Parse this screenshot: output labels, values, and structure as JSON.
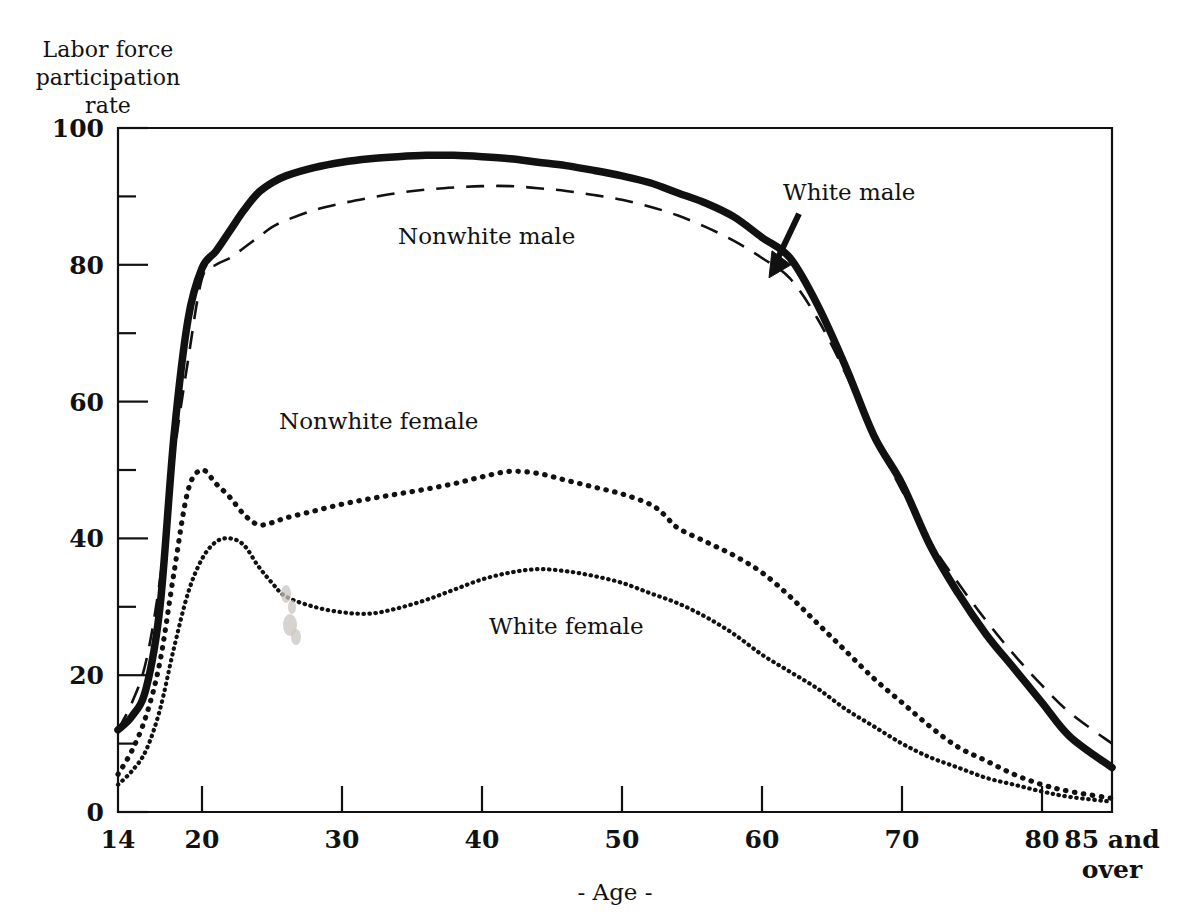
{
  "figure": {
    "y_axis_caption": "Labor force\nparticipation\nrate",
    "x_axis_caption": "- Age -"
  },
  "chart_data": {
    "type": "line",
    "title": "",
    "subtitle": "",
    "xlabel": "- Age -",
    "ylabel": "Labor force participation rate",
    "xlim": [
      14,
      85
    ],
    "ylim": [
      0,
      100
    ],
    "grid": false,
    "legend_position": "inline-annotations",
    "x_ticks": [
      {
        "value": 14,
        "label": "14"
      },
      {
        "value": 20,
        "label": "20"
      },
      {
        "value": 30,
        "label": "30"
      },
      {
        "value": 40,
        "label": "40"
      },
      {
        "value": 50,
        "label": "50"
      },
      {
        "value": 60,
        "label": "60"
      },
      {
        "value": 70,
        "label": "70"
      },
      {
        "value": 80,
        "label": "80"
      },
      {
        "value": 85,
        "label": "85 and\nover"
      }
    ],
    "y_ticks_major": [
      {
        "value": 0,
        "label": "0"
      },
      {
        "value": 20,
        "label": "20"
      },
      {
        "value": 40,
        "label": "40"
      },
      {
        "value": 60,
        "label": "60"
      },
      {
        "value": 80,
        "label": "80"
      },
      {
        "value": 100,
        "label": "100"
      }
    ],
    "y_ticks_minor": [
      10,
      30,
      50,
      70,
      90
    ],
    "annotations": [
      {
        "text": "White male",
        "x": 61.5,
        "y": 89.5,
        "has_arrow": true
      },
      {
        "text": "Nonwhite male",
        "x": 34.0,
        "y": 83.0,
        "has_arrow": false
      },
      {
        "text": "Nonwhite female",
        "x": 25.5,
        "y": 56.0,
        "has_arrow": false
      },
      {
        "text": "White female",
        "x": 40.5,
        "y": 26.0,
        "has_arrow": false
      }
    ],
    "series": [
      {
        "name": "White male",
        "style": "solid-thick",
        "x": [
          14,
          15,
          16,
          17,
          18,
          19,
          20,
          21,
          22,
          23,
          24,
          25,
          26,
          28,
          30,
          32,
          34,
          36,
          38,
          40,
          42,
          44,
          46,
          48,
          50,
          52,
          54,
          56,
          58,
          60,
          62,
          64,
          66,
          68,
          70,
          72,
          74,
          76,
          78,
          80,
          82,
          85
        ],
        "values": [
          12,
          14,
          18,
          30,
          55,
          72,
          79.5,
          82,
          85,
          88,
          90.5,
          92,
          93,
          94.2,
          95,
          95.5,
          95.8,
          96,
          96,
          95.8,
          95.5,
          95,
          94.5,
          93.8,
          93,
          92,
          90.5,
          89,
          87,
          84,
          81,
          74,
          65,
          55,
          48,
          39,
          32,
          26,
          21,
          16,
          11,
          6.5
        ]
      },
      {
        "name": "Nonwhite male",
        "style": "dashed",
        "x": [
          14,
          15,
          16,
          17,
          18,
          19,
          20,
          21,
          22,
          23,
          24,
          25,
          26,
          28,
          30,
          32,
          34,
          36,
          38,
          40,
          42,
          44,
          46,
          48,
          50,
          52,
          54,
          56,
          58,
          60,
          62,
          64,
          66,
          68,
          70,
          72,
          74,
          76,
          78,
          80,
          82,
          85
        ],
        "values": [
          12,
          16,
          22,
          34,
          52,
          66,
          78,
          80,
          81,
          82.5,
          84,
          85.5,
          86.5,
          88,
          89,
          89.8,
          90.5,
          91,
          91.3,
          91.5,
          91.5,
          91.2,
          90.8,
          90.2,
          89.5,
          88.5,
          87.2,
          85.5,
          83.5,
          81,
          78,
          72,
          64,
          55,
          47,
          39.5,
          33.5,
          28,
          23,
          18.5,
          14.5,
          10
        ]
      },
      {
        "name": "Nonwhite female",
        "style": "dotted-heavy",
        "x": [
          14,
          15,
          16,
          17,
          18,
          19,
          20,
          21,
          22,
          23,
          24,
          25,
          26,
          28,
          30,
          32,
          34,
          36,
          38,
          40,
          42,
          44,
          46,
          48,
          50,
          52,
          53,
          54,
          56,
          58,
          60,
          62,
          64,
          66,
          68,
          70,
          72,
          74,
          76,
          78,
          80,
          82,
          85
        ],
        "values": [
          5.5,
          9,
          14,
          22,
          35,
          47,
          50,
          48,
          46,
          43.5,
          42,
          42.3,
          43,
          44,
          45,
          45.8,
          46.5,
          47.2,
          48,
          49,
          49.8,
          49.5,
          48.5,
          47.5,
          46.5,
          45,
          43.5,
          41.5,
          39.5,
          37.5,
          35,
          31.5,
          27.5,
          23.5,
          19.5,
          16,
          12.5,
          9.5,
          7.5,
          5.5,
          4,
          3,
          2
        ]
      },
      {
        "name": "White female",
        "style": "dotted-fine",
        "x": [
          14,
          15,
          16,
          17,
          18,
          19,
          20,
          21,
          22,
          23,
          24,
          25,
          26,
          28,
          30,
          32,
          34,
          36,
          38,
          40,
          42,
          44,
          46,
          48,
          50,
          52,
          54,
          56,
          58,
          60,
          62,
          64,
          66,
          68,
          70,
          72,
          74,
          76,
          78,
          80,
          82,
          85
        ],
        "values": [
          4,
          6,
          9,
          15,
          24,
          32,
          37,
          39.5,
          40,
          39,
          36,
          33.5,
          31.5,
          30,
          29.2,
          29,
          29.8,
          31,
          32.5,
          34,
          35,
          35.5,
          35.2,
          34.5,
          33.5,
          32,
          30.5,
          28.5,
          26,
          23,
          20.5,
          18,
          15,
          12.5,
          10,
          8,
          6.5,
          5,
          4,
          3,
          2.2,
          1.5
        ]
      }
    ]
  }
}
